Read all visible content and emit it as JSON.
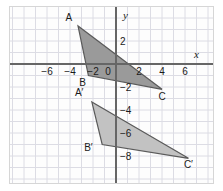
{
  "figure": {
    "background_color": "#fdfdfd",
    "border_color": "#d6d6d6"
  },
  "axes": {
    "x_axis_label": "x",
    "y_axis_label": "y",
    "axis_color": "#666666",
    "grid_color": "#dcdce4",
    "x_ticks": [
      {
        "value": -6,
        "label": "−6"
      },
      {
        "value": -4,
        "label": "−4"
      },
      {
        "value": -2,
        "label": "−2"
      },
      {
        "value": 0,
        "label": "0"
      },
      {
        "value": 2,
        "label": "2"
      },
      {
        "value": 4,
        "label": "4"
      },
      {
        "value": 6,
        "label": "6"
      }
    ],
    "y_ticks": [
      {
        "value": 2,
        "label": "2"
      },
      {
        "value": -2,
        "label": "−2"
      },
      {
        "value": -4,
        "label": "−4"
      },
      {
        "value": -6,
        "label": "−6"
      },
      {
        "value": -8,
        "label": "−8"
      }
    ],
    "xlim": [
      -8,
      7.5
    ],
    "ylim": [
      -9.5,
      4.5
    ],
    "grid": true
  },
  "chart_data": {
    "type": "scatter",
    "xlabel": "x",
    "ylabel": "y",
    "xlim": [
      -8,
      7.5
    ],
    "ylim": [
      -9.5,
      4.5
    ],
    "grid": true,
    "legend_position": "none",
    "shapes": [
      {
        "name": "triangle-abc",
        "fill": "#9a9a9a",
        "stroke": "#5a5a5a",
        "vertices": [
          {
            "label": "A",
            "x": -3.3,
            "y": 3.3
          },
          {
            "label": "B",
            "x": -2.4,
            "y": -1.0
          },
          {
            "label": "C",
            "x": 4.0,
            "y": -2.2
          }
        ]
      },
      {
        "name": "triangle-a-prime-b-prime-c-prime",
        "fill": "#c2c2c2",
        "stroke": "#5a5a5a",
        "vertices": [
          {
            "label": "A'",
            "x": -2.1,
            "y": -3.3
          },
          {
            "label": "B'",
            "x": -1.2,
            "y": -7.0
          },
          {
            "label": "C'",
            "x": 6.3,
            "y": -8.2
          }
        ]
      }
    ]
  },
  "vertex_labels": [
    {
      "name": "A",
      "text": "A",
      "x": -4.1,
      "y": 3.7
    },
    {
      "name": "B",
      "text": "B",
      "x": -2.9,
      "y": -1.9
    },
    {
      "name": "C",
      "text": "C",
      "x": 4.0,
      "y": -3.1
    },
    {
      "name": "Aprime",
      "text": "A′",
      "x": -3.2,
      "y": -2.8
    },
    {
      "name": "Bprime",
      "text": "B′",
      "x": -2.4,
      "y": -7.6
    },
    {
      "name": "Cprime",
      "text": "C′",
      "x": 6.3,
      "y": -9.0
    }
  ]
}
